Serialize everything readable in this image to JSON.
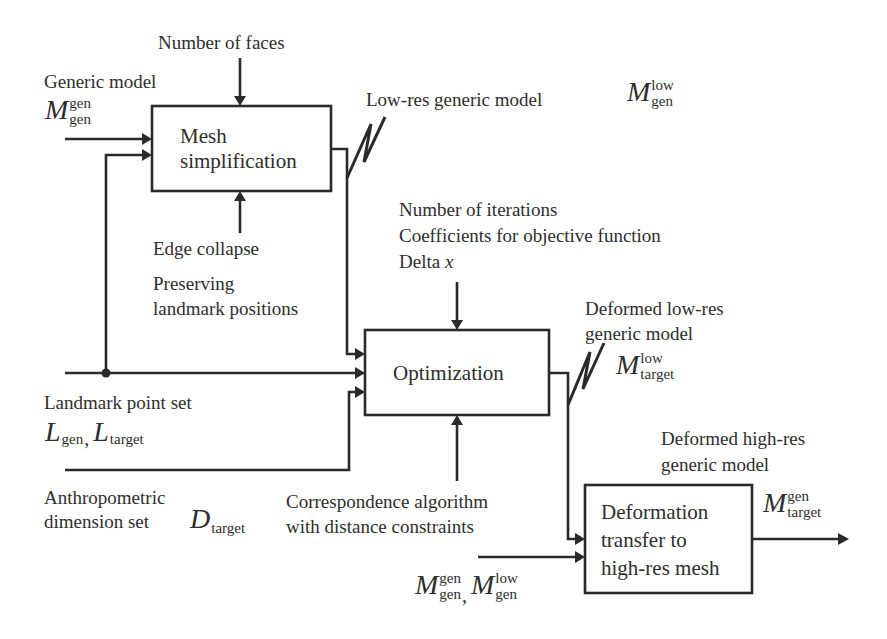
{
  "diagram": {
    "type": "block-flow-diagram",
    "blocks": {
      "mesh_simplification": {
        "lines": [
          "Mesh",
          "simplification"
        ]
      },
      "optimization": {
        "lines": [
          "Optimization"
        ]
      },
      "deformation_transfer": {
        "lines": [
          "Deformation",
          "transfer to",
          "high-res mesh"
        ]
      }
    },
    "labels": {
      "number_of_faces": "Number of faces",
      "generic_model": "Generic model",
      "low_res_generic_model": "Low-res generic model",
      "edge_collapse": "Edge collapse",
      "preserving": "Preserving",
      "landmark_positions": "landmark positions",
      "number_of_iterations": "Number of iterations",
      "coefficients": "Coefficients for objective function",
      "delta": "Delta",
      "delta_var": "x",
      "deformed_low_res_1": "Deformed low-res",
      "deformed_low_res_2": "generic model",
      "landmark_point_set": "Landmark point set",
      "anthropometric_1": "Anthropometric",
      "anthropometric_2": "dimension set",
      "correspondence_1": "Correspondence algorithm",
      "correspondence_2": "with distance constraints",
      "deformed_high_res_1": "Deformed high-res",
      "deformed_high_res_2": "generic model"
    },
    "math": {
      "M_gen_gen": {
        "symbol": "M",
        "sup": "gen",
        "sub": "gen"
      },
      "M_gen_low": {
        "symbol": "M",
        "sup": "low",
        "sub": "gen"
      },
      "M_target_low": {
        "symbol": "M",
        "sup": "low",
        "sub": "target"
      },
      "L_gen": {
        "symbol": "L",
        "sub": "gen"
      },
      "L_target": {
        "symbol": "L",
        "sub": "target"
      },
      "D_target": {
        "symbol": "D",
        "sub": "target"
      },
      "M_target_gen": {
        "symbol": "M",
        "sup": "gen",
        "sub": "target"
      },
      "bottom_M_gen_gen": {
        "symbol": "M",
        "sup": "gen",
        "sub": "gen"
      },
      "bottom_M_gen_low": {
        "symbol": "M",
        "sup": "low",
        "sub": "gen"
      },
      "comma": ","
    },
    "colors": {
      "line": "#2a2a2a",
      "text": "#2e2e2e",
      "background": "#ffffff"
    }
  }
}
